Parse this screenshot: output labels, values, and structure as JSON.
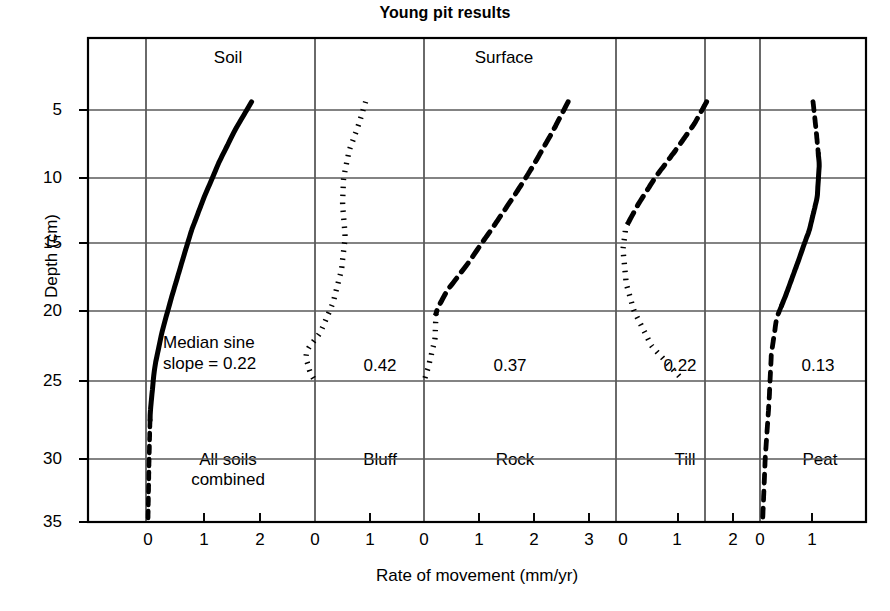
{
  "chart_data": {
    "type": "line",
    "title": "Young pit results",
    "xlabel": "Rate of movement (mm/yr)",
    "ylabel": "Depth (cm)",
    "ylim": [
      2,
      35
    ],
    "yticks": [
      5,
      10,
      15,
      20,
      25,
      30,
      35
    ],
    "grid": true,
    "legend_position": "none",
    "group_headers": [
      {
        "label": "Soil",
        "panels": [
          1,
          2
        ]
      },
      {
        "label": "Surface",
        "panels": [
          3,
          4
        ]
      }
    ],
    "annotation": "Median sine\nslope = 0.22",
    "annotation_line1": "Median sine",
    "annotation_line2": "slope = 0.22",
    "panels": [
      {
        "name": "All soils",
        "name_line1": "All soils",
        "name_line2": "combined",
        "median_sine_slope": "0.22",
        "xlim": [
          0,
          2.6
        ],
        "xticks": [
          0,
          1,
          2
        ],
        "xtick_labels": [
          "0",
          "1",
          "2"
        ],
        "linestyle": "solid-then-dashed",
        "series": [
          {
            "rate": 1.85,
            "depth": 4.4
          },
          {
            "rate": 1.55,
            "depth": 6.5
          },
          {
            "rate": 1.25,
            "depth": 9.0
          },
          {
            "rate": 1.0,
            "depth": 11.5
          },
          {
            "rate": 0.78,
            "depth": 14.0
          },
          {
            "rate": 0.6,
            "depth": 16.5
          },
          {
            "rate": 0.42,
            "depth": 19.0
          },
          {
            "rate": 0.25,
            "depth": 21.5
          },
          {
            "rate": 0.12,
            "depth": 24.0
          },
          {
            "rate": 0.04,
            "depth": 27.0
          },
          {
            "rate": 0.02,
            "depth": 30.0
          },
          {
            "rate": 0.0,
            "depth": 35.0
          }
        ]
      },
      {
        "name": "Bluff",
        "name_line1": "Bluff",
        "name_line2": "",
        "median_sine_slope": "0.42",
        "xlim": [
          0,
          2.0
        ],
        "xticks": [
          0,
          1
        ],
        "xtick_labels": [
          "0",
          "1"
        ],
        "linestyle": "dotted",
        "series": [
          {
            "rate": 0.92,
            "depth": 4.4
          },
          {
            "rate": 0.8,
            "depth": 6.0
          },
          {
            "rate": 0.62,
            "depth": 8.0
          },
          {
            "rate": 0.52,
            "depth": 10.0
          },
          {
            "rate": 0.5,
            "depth": 12.0
          },
          {
            "rate": 0.55,
            "depth": 14.5
          },
          {
            "rate": 0.48,
            "depth": 17.0
          },
          {
            "rate": 0.32,
            "depth": 19.5
          },
          {
            "rate": 0.1,
            "depth": 21.5
          },
          {
            "rate": -0.18,
            "depth": 23.0
          },
          {
            "rate": -0.1,
            "depth": 24.3
          },
          {
            "rate": 0.0,
            "depth": 25.0
          }
        ]
      },
      {
        "name": "Rock",
        "name_line1": "Rock",
        "name_line2": "",
        "median_sine_slope": "0.37",
        "xlim": [
          0,
          3.4
        ],
        "xticks": [
          0,
          1,
          2,
          3
        ],
        "xtick_labels": [
          "0",
          "1",
          "2",
          "3"
        ],
        "linestyle": "dashed",
        "series": [
          {
            "rate": 2.62,
            "depth": 4.4
          },
          {
            "rate": 2.35,
            "depth": 6.5
          },
          {
            "rate": 2.0,
            "depth": 9.0
          },
          {
            "rate": 1.62,
            "depth": 11.5
          },
          {
            "rate": 1.22,
            "depth": 14.0
          },
          {
            "rate": 0.8,
            "depth": 16.5
          },
          {
            "rate": 0.42,
            "depth": 18.5
          },
          {
            "rate": 0.22,
            "depth": 20.0
          },
          {
            "rate": 0.2,
            "depth": 22.0
          },
          {
            "rate": 0.08,
            "depth": 24.0
          },
          {
            "rate": 0.0,
            "depth": 25.0
          }
        ]
      },
      {
        "name": "Till",
        "name_line1": "Till",
        "name_line2": "",
        "median_sine_slope": "0.22",
        "xlim": [
          0,
          2.5
        ],
        "xticks": [
          0,
          1,
          2
        ],
        "xtick_labels": [
          "0",
          "1",
          "2"
        ],
        "linestyle": "dashed-then-dotted",
        "series": [
          {
            "rate": 1.52,
            "depth": 4.4
          },
          {
            "rate": 1.3,
            "depth": 6.0
          },
          {
            "rate": 0.95,
            "depth": 8.0
          },
          {
            "rate": 0.58,
            "depth": 10.0
          },
          {
            "rate": 0.28,
            "depth": 12.0
          },
          {
            "rate": 0.05,
            "depth": 13.8
          },
          {
            "rate": 0.0,
            "depth": 15.5
          },
          {
            "rate": 0.06,
            "depth": 18.0
          },
          {
            "rate": 0.2,
            "depth": 20.0
          },
          {
            "rate": 0.52,
            "depth": 22.5
          },
          {
            "rate": 1.1,
            "depth": 25.0
          }
        ]
      },
      {
        "name": "Peat",
        "name_line1": "Peat",
        "name_line2": "",
        "median_sine_slope": "0.13",
        "xlim": [
          0,
          2.0
        ],
        "xticks": [
          0,
          1
        ],
        "xtick_labels": [
          "0",
          "1"
        ],
        "linestyle": "dashed-solid-dashed",
        "series": [
          {
            "rate": 1.02,
            "depth": 4.4
          },
          {
            "rate": 1.08,
            "depth": 6.5
          },
          {
            "rate": 1.14,
            "depth": 9.0
          },
          {
            "rate": 1.1,
            "depth": 11.5
          },
          {
            "rate": 0.95,
            "depth": 14.0
          },
          {
            "rate": 0.72,
            "depth": 16.5
          },
          {
            "rate": 0.5,
            "depth": 18.8
          },
          {
            "rate": 0.32,
            "depth": 20.5
          },
          {
            "rate": 0.22,
            "depth": 23.0
          },
          {
            "rate": 0.18,
            "depth": 26.0
          },
          {
            "rate": 0.1,
            "depth": 30.0
          },
          {
            "rate": 0.05,
            "depth": 35.0
          }
        ]
      }
    ]
  },
  "colors": {
    "line": "#000000",
    "grid": "#5a5a5a",
    "frame": "#000000",
    "background": "#ffffff"
  }
}
